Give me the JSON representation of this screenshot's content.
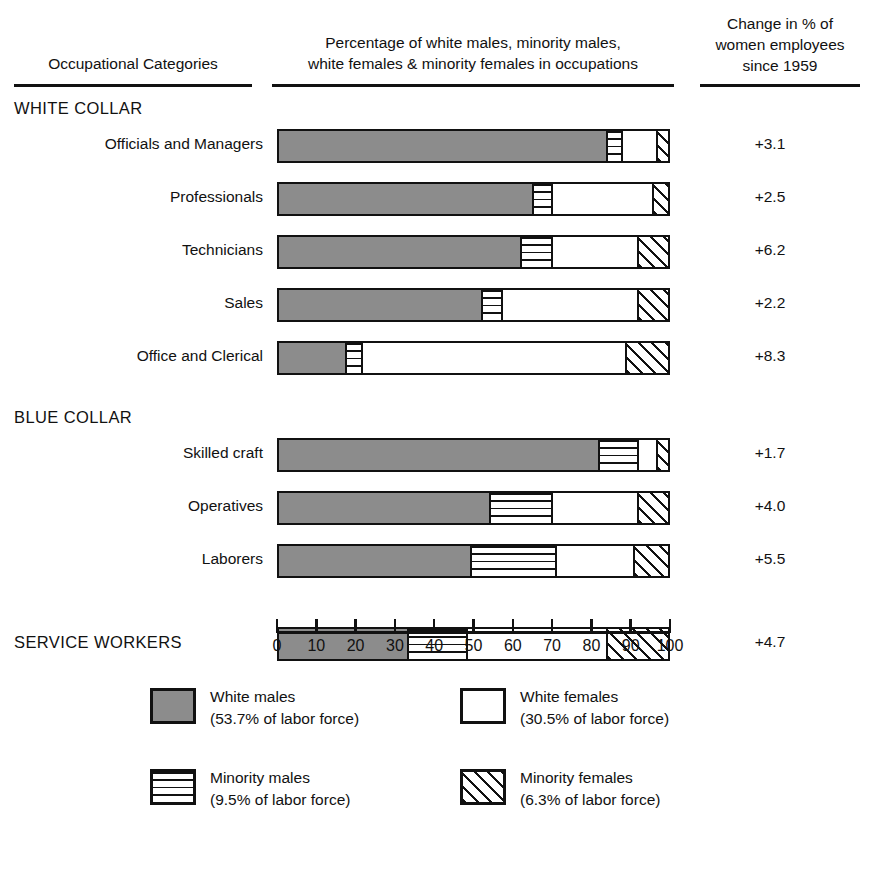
{
  "header": {
    "col_occupations": "Occupational Categories",
    "col_middle_line1": "Percentage of white males, minority males,",
    "col_middle_line2": "white females & minority females in occupations",
    "col_change_line1": "Change in % of",
    "col_change_line2": "women employees",
    "col_change_line3": "since 1959"
  },
  "groups": {
    "white_collar": "WHITE COLLAR",
    "blue_collar": "BLUE COLLAR",
    "service_workers": "SERVICE WORKERS"
  },
  "axis": {
    "ticks": [
      "0",
      "10",
      "20",
      "30",
      "40",
      "50",
      "60",
      "70",
      "80",
      "90",
      "100"
    ],
    "min": 0,
    "max": 100
  },
  "legend": {
    "items": [
      {
        "key": "white_males",
        "label": "White males",
        "note": "(53.7% of labor force)",
        "swatch": "solid-gray",
        "color": "#8c8c8c"
      },
      {
        "key": "white_females",
        "label": "White females",
        "note": "(30.5% of labor force)",
        "swatch": "open-white",
        "color": "#ffffff"
      },
      {
        "key": "minority_males",
        "label": "Minority males",
        "note": "(9.5% of labor force)",
        "swatch": "horizontal-lines",
        "color": "#ffffff"
      },
      {
        "key": "minority_females",
        "label": "Minority females",
        "note": "(6.3% of labor force)",
        "swatch": "diagonal-hatch",
        "color": "#ffffff"
      }
    ]
  },
  "chart_data": {
    "type": "bar",
    "title": "Percentage of white males, minority males, white females & minority females in occupations",
    "xlabel": "",
    "ylabel": "Occupational Categories",
    "xlim": [
      0,
      100
    ],
    "grid": false,
    "stacked": true,
    "orientation": "horizontal",
    "legend_position": "bottom",
    "categories": [
      "Officials and Managers",
      "Professionals",
      "Technicians",
      "Sales",
      "Office and Clerical",
      "Skilled craft",
      "Operatives",
      "Laborers",
      "SERVICE WORKERS"
    ],
    "series": [
      {
        "name": "White males",
        "values": [
          84,
          65,
          62,
          52,
          17,
          82,
          54,
          49,
          33
        ]
      },
      {
        "name": "Minority males",
        "values": [
          4,
          5,
          8,
          5,
          4,
          10,
          16,
          22,
          15
        ]
      },
      {
        "name": "White females",
        "values": [
          9,
          26,
          22,
          35,
          68,
          5,
          22,
          20,
          36
        ]
      },
      {
        "name": "Minority females",
        "values": [
          3,
          4,
          8,
          8,
          11,
          3,
          8,
          9,
          16
        ]
      }
    ],
    "change_column_label": "Change in % of women employees since 1959",
    "change_values": [
      "+3.1",
      "+2.5",
      "+6.2",
      "+2.2",
      "+8.3",
      "+1.7",
      "+4.0",
      "+5.5",
      "+4.7"
    ]
  },
  "rows": [
    {
      "label": "Officials and Managers",
      "change": "+3.1",
      "segments": [
        84,
        4,
        9,
        3
      ],
      "group": "white_collar",
      "caps": false
    },
    {
      "label": "Professionals",
      "change": "+2.5",
      "segments": [
        65,
        5,
        26,
        4
      ],
      "group": "white_collar",
      "caps": false
    },
    {
      "label": "Technicians",
      "change": "+6.2",
      "segments": [
        62,
        8,
        22,
        8
      ],
      "group": "white_collar",
      "caps": false
    },
    {
      "label": "Sales",
      "change": "+2.2",
      "segments": [
        52,
        5,
        35,
        8
      ],
      "group": "white_collar",
      "caps": false
    },
    {
      "label": "Office and Clerical",
      "change": "+8.3",
      "segments": [
        17,
        4,
        68,
        11
      ],
      "group": "white_collar",
      "caps": false
    },
    {
      "label": "Skilled craft",
      "change": "+1.7",
      "segments": [
        82,
        10,
        5,
        3
      ],
      "group": "blue_collar",
      "caps": false
    },
    {
      "label": "Operatives",
      "change": "+4.0",
      "segments": [
        54,
        16,
        22,
        8
      ],
      "group": "blue_collar",
      "caps": false
    },
    {
      "label": "Laborers",
      "change": "+5.5",
      "segments": [
        49,
        22,
        20,
        9
      ],
      "group": "blue_collar",
      "caps": false
    },
    {
      "label": "SERVICE WORKERS",
      "change": "+4.7",
      "segments": [
        33,
        15,
        36,
        16
      ],
      "group": "service",
      "caps": true
    }
  ]
}
